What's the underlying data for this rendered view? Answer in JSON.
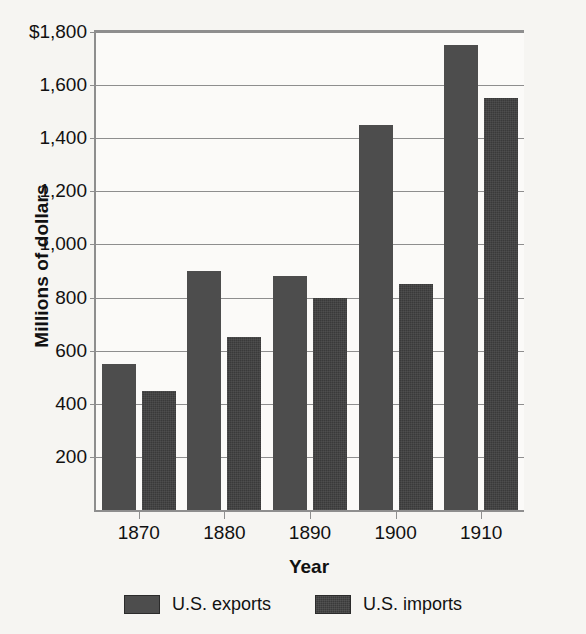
{
  "chart_data": {
    "type": "bar",
    "title": "",
    "xlabel": "Year",
    "ylabel": "Millions of dollars",
    "categories": [
      "1870",
      "1880",
      "1890",
      "1900",
      "1910"
    ],
    "series": [
      {
        "name": "U.S. exports",
        "color": "#4d4d4d",
        "values": [
          550,
          900,
          880,
          1450,
          1750
        ]
      },
      {
        "name": "U.S. imports",
        "color": "#3a3a3a",
        "values": [
          450,
          650,
          800,
          850,
          1550
        ]
      }
    ],
    "ylim": [
      0,
      1800
    ],
    "yticks": [
      200,
      400,
      600,
      800,
      1000,
      1200,
      1400,
      1600,
      1800
    ],
    "ytick_labels": [
      "200",
      "400",
      "600",
      "800",
      "1,000",
      "1,200",
      "1,400",
      "1,600",
      "$1,800"
    ],
    "grid": true,
    "legend_position": "bottom",
    "background_color": "#f6f5f2",
    "gridline_color": "#8e8e8e"
  },
  "legend": {
    "entries": [
      {
        "label": "U.S. exports"
      },
      {
        "label": "U.S. imports"
      }
    ]
  },
  "axes": {
    "x_title": "Year",
    "y_title": "Millions of dollars"
  }
}
